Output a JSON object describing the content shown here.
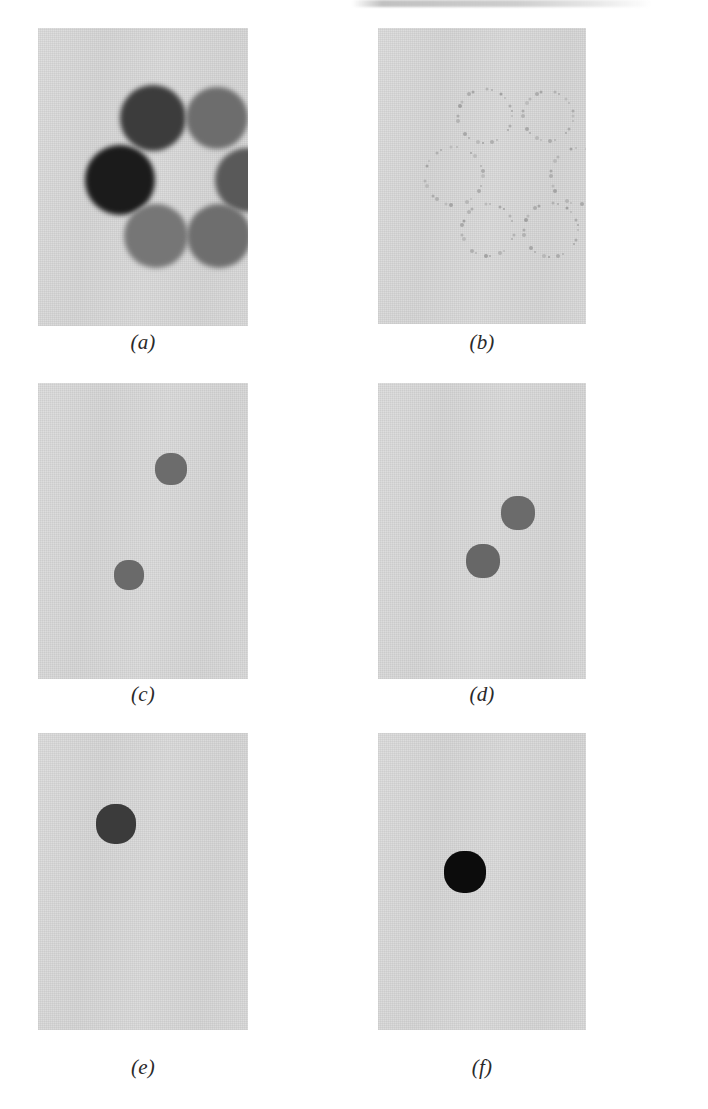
{
  "figure": {
    "caption_style": "italic-parenthesized-letter",
    "panel_width": 210,
    "panel_height": 298,
    "background_color": "#d9d9d9",
    "page_background": "#ffffff",
    "columns": 2,
    "rows": 3
  },
  "panels": [
    {
      "id": "panel-a",
      "caption": "(a)",
      "x": 38,
      "y": 28,
      "w": 210,
      "h": 298,
      "caption_y": 330,
      "kind": "grayscale-blobs",
      "description": "six soft circular blobs of varying gray level arranged in a hexagonal ring",
      "blob_count": 6,
      "blobs": [
        {
          "name": "top-left",
          "cx": 115,
          "cy": 90,
          "r": 33,
          "color": "#3c3c3c"
        },
        {
          "name": "top-right",
          "cx": 179,
          "cy": 90,
          "r": 31,
          "color": "#6d6d6d"
        },
        {
          "name": "mid-left",
          "cx": 82,
          "cy": 152,
          "r": 35,
          "color": "#1b1b1b"
        },
        {
          "name": "mid-right",
          "cx": 209,
          "cy": 152,
          "r": 32,
          "color": "#595959"
        },
        {
          "name": "bottom-left",
          "cx": 118,
          "cy": 208,
          "r": 32,
          "color": "#767676"
        },
        {
          "name": "bottom-right",
          "cx": 181,
          "cy": 208,
          "r": 32,
          "color": "#6e6e6e"
        }
      ]
    },
    {
      "id": "panel-b",
      "caption": "(b)",
      "x": 378,
      "y": 28,
      "w": 208,
      "h": 296,
      "caption_y": 330,
      "kind": "edge-contours",
      "description": "six faint broken dotted circular outlines (edge map) in the same hexagonal arrangement",
      "ring_count": 6,
      "rings": [
        {
          "name": "top-left",
          "cx": 107,
          "cy": 88,
          "r": 27,
          "color": "#9b9b9b"
        },
        {
          "name": "top-right",
          "cx": 170,
          "cy": 88,
          "r": 25,
          "color": "#a2a2a2"
        },
        {
          "name": "mid-left",
          "cx": 76,
          "cy": 148,
          "r": 29,
          "color": "#a0a0a0"
        },
        {
          "name": "mid-right",
          "cx": 201,
          "cy": 148,
          "r": 28,
          "color": "#9e9e9e"
        },
        {
          "name": "bottom-left",
          "cx": 110,
          "cy": 202,
          "r": 26,
          "color": "#9c9c9c"
        },
        {
          "name": "bottom-right",
          "cx": 173,
          "cy": 202,
          "r": 27,
          "color": "#9a9a9a"
        }
      ]
    },
    {
      "id": "panel-c",
      "caption": "(c)",
      "x": 38,
      "y": 383,
      "w": 210,
      "h": 296,
      "caption_y": 682,
      "kind": "thresholded-blobs",
      "description": "two medium-gray pixelated blobs, one upper-right and one lower-left",
      "blob_count": 2,
      "blobs": [
        {
          "name": "upper-right",
          "cx": 133,
          "cy": 86,
          "r": 16,
          "color": "#6c6c6c"
        },
        {
          "name": "lower-left",
          "cx": 91,
          "cy": 192,
          "r": 15,
          "color": "#6a6a6a"
        }
      ]
    },
    {
      "id": "panel-d",
      "caption": "(d)",
      "x": 378,
      "y": 383,
      "w": 208,
      "h": 296,
      "caption_y": 682,
      "kind": "thresholded-blobs",
      "description": "two medium-gray pixelated blobs on the right side arranged diagonally",
      "blob_count": 2,
      "blobs": [
        {
          "name": "upper-right",
          "cx": 140,
          "cy": 130,
          "r": 17,
          "color": "#6b6b6b"
        },
        {
          "name": "lower-left",
          "cx": 105,
          "cy": 178,
          "r": 17,
          "color": "#676767"
        }
      ]
    },
    {
      "id": "panel-e",
      "caption": "(e)",
      "x": 38,
      "y": 733,
      "w": 210,
      "h": 297,
      "caption_y": 1055,
      "kind": "thresholded-blobs",
      "description": "a single dark gray pixelated blob in the upper-left quadrant",
      "blob_count": 1,
      "blobs": [
        {
          "name": "single",
          "cx": 78,
          "cy": 91,
          "r": 20,
          "color": "#3b3b3b"
        }
      ]
    },
    {
      "id": "panel-f",
      "caption": "(f)",
      "x": 378,
      "y": 733,
      "w": 208,
      "h": 297,
      "caption_y": 1055,
      "kind": "thresholded-blobs",
      "description": "a single near-black pixelated blob at left of center",
      "blob_count": 1,
      "blobs": [
        {
          "name": "single",
          "cx": 87,
          "cy": 139,
          "r": 21,
          "color": "#0c0c0c"
        }
      ]
    }
  ]
}
